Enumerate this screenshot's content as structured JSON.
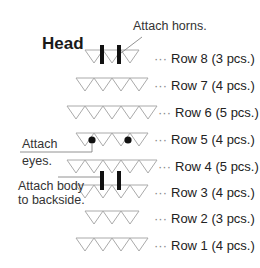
{
  "diagram": {
    "title": "Head",
    "annotations": {
      "horns": "Attach horns.",
      "eyes_line1": "Attach",
      "eyes_line2": "eyes.",
      "body_line1": "Attach body",
      "body_line2": "to backside."
    },
    "rows": [
      {
        "label": "Row 8 (3 pcs.)",
        "count": 3
      },
      {
        "label": "Row 7 (4 pcs.)",
        "count": 4
      },
      {
        "label": "Row 6 (5 pcs.)",
        "count": 5
      },
      {
        "label": "Row 5 (4 pcs.)",
        "count": 4
      },
      {
        "label": "Row 4 (5 pcs.)",
        "count": 5
      },
      {
        "label": "Row 3 (4 pcs.)",
        "count": 4
      },
      {
        "label": "Row 2 (3 pcs.)",
        "count": 3
      },
      {
        "label": "Row 1 (4 pcs.)",
        "count": 4
      }
    ],
    "dots": "···",
    "colors": {
      "triangle_stroke": "#aaaaaa",
      "bar": "#111111",
      "leader": "#777777"
    }
  }
}
